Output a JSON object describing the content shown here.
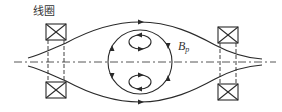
{
  "diagram": {
    "labels": {
      "coil": "线圈",
      "field_symbol": "B",
      "field_subscript": "p"
    },
    "elements": {
      "coils": [
        {
          "id": "left-top-coil",
          "x": 46,
          "y": 24,
          "w": 20,
          "h": 16
        },
        {
          "id": "left-bottom-coil",
          "x": 46,
          "y": 82,
          "w": 20,
          "h": 16
        },
        {
          "id": "right-top-coil",
          "x": 218,
          "y": 27,
          "w": 20,
          "h": 16
        },
        {
          "id": "right-bottom-coil",
          "x": 218,
          "y": 84,
          "w": 20,
          "h": 16
        }
      ],
      "axis_y": 62,
      "central_loop": {
        "cx": 140,
        "cy": 62,
        "r": 32
      },
      "inner_loops": [
        {
          "cx": 140,
          "cy": 42,
          "rx": 11,
          "ry": 7
        },
        {
          "cx": 140,
          "cy": 82,
          "rx": 11,
          "ry": 7
        }
      ]
    },
    "colors": {
      "line": "#2a2a2a",
      "text": "#333333",
      "background": "#ffffff"
    }
  }
}
